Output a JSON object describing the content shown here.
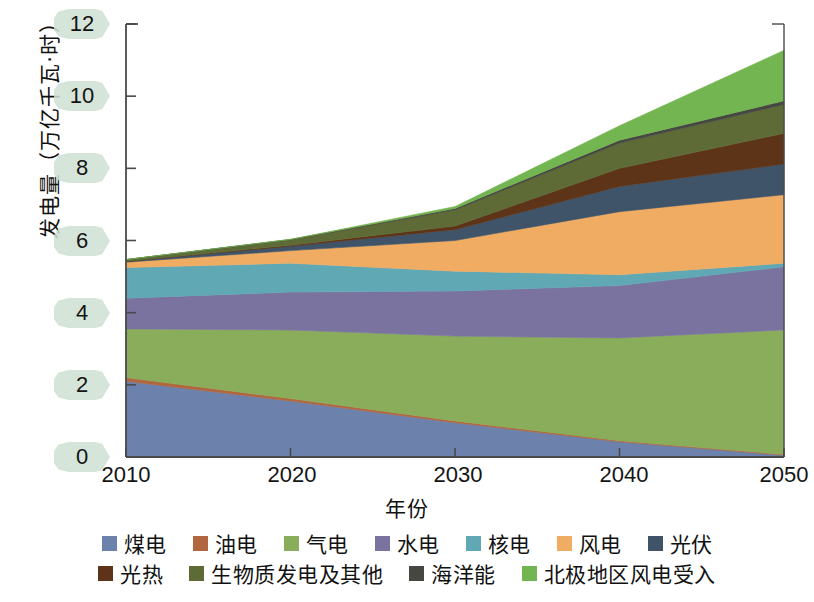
{
  "chart_data": {
    "type": "area",
    "stacked": true,
    "title": "",
    "xlabel": "年份",
    "ylabel": "发电量（万亿千瓦·时）",
    "x": [
      2010,
      2020,
      2030,
      2040,
      2050
    ],
    "xtick_labels": [
      "2010",
      "2020",
      "2030",
      "2040",
      "2050"
    ],
    "ytick_labels": [
      "0",
      "2",
      "4",
      "6",
      "8",
      "10",
      "12"
    ],
    "ytick_values": [
      0,
      2,
      4,
      6,
      8,
      10,
      12
    ],
    "ylim": [
      0,
      12
    ],
    "xlim": [
      2010,
      2050
    ],
    "grid": false,
    "legend_position": "bottom",
    "series": [
      {
        "name": "煤电",
        "color": "#6c82ad",
        "values": [
          2.1,
          1.55,
          0.95,
          0.42,
          0.05
        ]
      },
      {
        "name": "油电",
        "color": "#b0673f",
        "values": [
          0.1,
          0.07,
          0.05,
          0.03,
          0.02
        ]
      },
      {
        "name": "气电",
        "color": "#8aad5b",
        "values": [
          1.35,
          1.9,
          2.35,
          2.85,
          3.45
        ]
      },
      {
        "name": "水电",
        "color": "#7a73a0",
        "values": [
          0.85,
          1.05,
          1.25,
          1.45,
          1.75
        ]
      },
      {
        "name": "核电",
        "color": "#61a8b5",
        "values": [
          0.85,
          0.8,
          0.55,
          0.3,
          0.1
        ]
      },
      {
        "name": "风电",
        "color": "#f0ac63",
        "values": [
          0.15,
          0.35,
          0.85,
          1.75,
          1.9
        ]
      },
      {
        "name": "光伏",
        "color": "#3f5469",
        "values": [
          0.02,
          0.12,
          0.3,
          0.7,
          0.85
        ]
      },
      {
        "name": "光热",
        "color": "#5d3418",
        "values": [
          0.0,
          0.03,
          0.1,
          0.5,
          0.85
        ]
      },
      {
        "name": "生物质发电及其他",
        "color": "#5e6b36",
        "values": [
          0.05,
          0.15,
          0.45,
          0.7,
          0.8
        ]
      },
      {
        "name": "海洋能",
        "color": "#474742",
        "values": [
          0.0,
          0.01,
          0.04,
          0.08,
          0.1
        ]
      },
      {
        "name": "北极地区风电受入",
        "color": "#73b550",
        "values": [
          0.0,
          0.0,
          0.05,
          0.4,
          1.4
        ]
      }
    ],
    "totals": [
      5.47,
      6.03,
      6.94,
      9.18,
      11.27
    ],
    "legend_rows": [
      [
        "煤电",
        "油电",
        "气电",
        "水电",
        "核电",
        "风电",
        "光伏"
      ],
      [
        "光热",
        "生物质发电及其他",
        "海洋能",
        "北极地区风电受入"
      ]
    ],
    "axis_color": "#4a4a4a",
    "tick_pill_color": "#cfe0d3"
  }
}
